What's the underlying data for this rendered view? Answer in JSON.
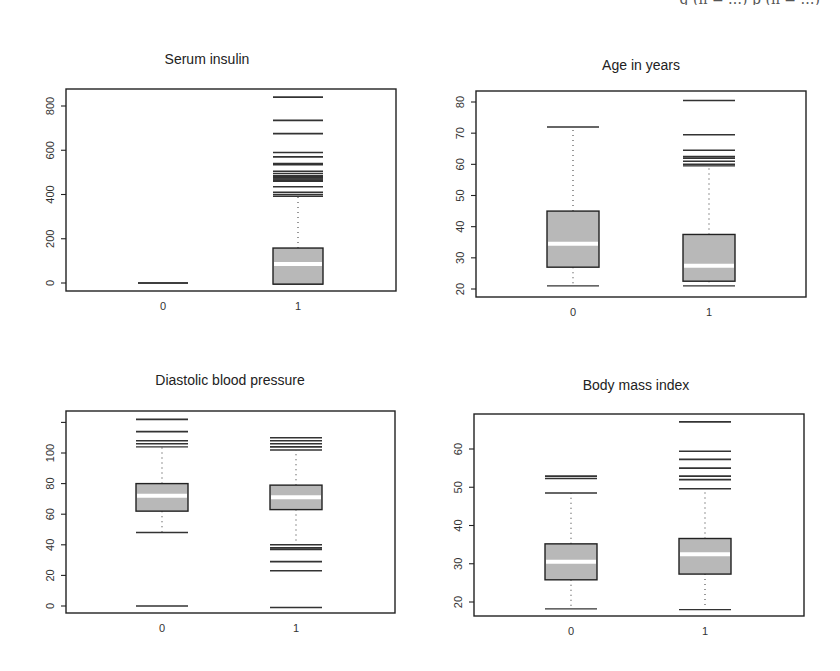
{
  "caption_fragment": "g (n = …)                                   p               (n = …)",
  "chart_data": [
    {
      "type": "box",
      "title": "Serum insulin",
      "categories": [
        "0",
        "1"
      ],
      "yticks": [
        0,
        200,
        400,
        600,
        800
      ],
      "ylim": [
        -20,
        900
      ],
      "frame": {
        "x0": 66,
        "x1": 396,
        "y0": 89,
        "y1": 291
      },
      "ymap": {
        "v0": 0,
        "p0": 283,
        "v1": 800,
        "p1": 106
      },
      "centers": [
        163,
        298
      ],
      "half_width": 25,
      "title_pos": {
        "x": 207,
        "y": 64
      },
      "groups": [
        {
          "name": "0",
          "q1": 0,
          "median": 0,
          "q3": 0,
          "whisker_low": 0,
          "whisker_high": 0,
          "outliers": []
        },
        {
          "name": "1",
          "q1": -5,
          "median": 86,
          "q3": 158,
          "whisker_low": -5,
          "whisker_high": 392,
          "outliers": [
            400,
            410,
            435,
            460,
            465,
            470,
            475,
            480,
            485,
            495,
            505,
            535,
            540,
            570,
            590,
            675,
            735,
            840
          ]
        }
      ]
    },
    {
      "type": "box",
      "title": "Age in years",
      "categories": [
        "0",
        "1"
      ],
      "yticks": [
        20,
        30,
        40,
        50,
        60,
        70,
        80
      ],
      "ylim": [
        18,
        83
      ],
      "frame": {
        "x0": 476,
        "x1": 806,
        "y0": 91,
        "y1": 297
      },
      "ymap": {
        "v0": 20,
        "p0": 289,
        "v1": 80,
        "p1": 102
      },
      "centers": [
        573,
        709
      ],
      "half_width": 26,
      "title_pos": {
        "x": 641,
        "y": 70
      },
      "groups": [
        {
          "name": "0",
          "q1": 27,
          "median": 34.5,
          "q3": 45,
          "whisker_low": 21,
          "whisker_high": 72,
          "outliers": []
        },
        {
          "name": "1",
          "q1": 22.5,
          "median": 27.5,
          "q3": 37.5,
          "whisker_low": 21,
          "whisker_high": 59.5,
          "outliers": [
            60,
            61,
            62,
            62.5,
            64.5,
            69.5,
            80.5
          ]
        }
      ]
    },
    {
      "type": "box",
      "title": "Diastolic blood pressure",
      "categories": [
        "0",
        "1"
      ],
      "yticks": [
        0,
        20,
        40,
        60,
        80,
        100,
        120
      ],
      "ytick_labels": [
        "0",
        "20",
        "40",
        "60",
        "80",
        "100",
        ""
      ],
      "ylim": [
        -5,
        125
      ],
      "frame": {
        "x0": 66,
        "x1": 395,
        "y0": 411,
        "y1": 613
      },
      "ymap": {
        "v0": 0,
        "p0": 606,
        "v1": 100,
        "p1": 453
      },
      "centers": [
        162,
        296
      ],
      "half_width": 26,
      "title_pos": {
        "x": 230,
        "y": 385
      },
      "groups": [
        {
          "name": "0",
          "q1": 62,
          "median": 72,
          "q3": 80,
          "whisker_low": 48,
          "whisker_high": 104,
          "outliers": [
            0,
            106,
            108,
            114,
            122
          ]
        },
        {
          "name": "1",
          "q1": 63,
          "median": 71,
          "q3": 79,
          "whisker_low": 40,
          "whisker_high": 102,
          "outliers": [
            -1,
            23,
            29,
            37,
            38,
            104,
            106,
            108,
            110
          ]
        }
      ]
    },
    {
      "type": "box",
      "title": "Body mass index",
      "categories": [
        "0",
        "1"
      ],
      "yticks": [
        20,
        30,
        40,
        50,
        60
      ],
      "ylim": [
        16,
        69
      ],
      "frame": {
        "x0": 474,
        "x1": 804,
        "y0": 414,
        "y1": 616
      },
      "ymap": {
        "v0": 20,
        "p0": 602,
        "v1": 60,
        "p1": 449
      },
      "centers": [
        571,
        705
      ],
      "half_width": 26,
      "title_pos": {
        "x": 636,
        "y": 390
      },
      "groups": [
        {
          "name": "0",
          "q1": 25.8,
          "median": 30.5,
          "q3": 35.2,
          "whisker_low": 18.2,
          "whisker_high": 48.5,
          "outliers": [
            52.3,
            52.9
          ]
        },
        {
          "name": "1",
          "q1": 27.3,
          "median": 32.5,
          "q3": 36.6,
          "whisker_low": 18,
          "whisker_high": 49.6,
          "outliers": [
            52,
            52.9,
            55,
            57.3,
            59.4,
            67.1
          ]
        }
      ]
    }
  ]
}
